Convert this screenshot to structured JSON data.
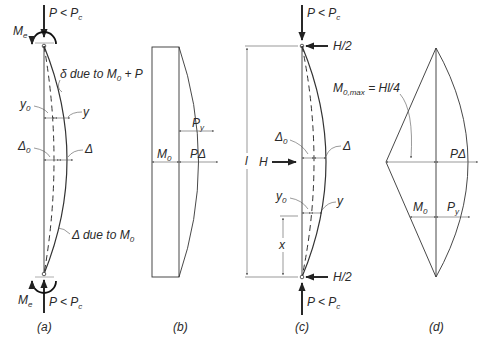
{
  "figure": {
    "panel_a": {
      "caption": "(a)",
      "top_load": "P < P",
      "top_load_sub": "c",
      "top_moment": "M",
      "top_moment_sub": "e",
      "bottom_load": "P < P",
      "bottom_load_sub": "c",
      "bottom_moment": "M",
      "bottom_moment_sub": "e",
      "delta_label_prefix": "δ due to M",
      "delta_label_sub": "0",
      "delta_label_suffix": " + P",
      "y0_label": "y",
      "y0_sub": "0",
      "y_label": "y",
      "Delta0_label": "Δ",
      "Delta0_sub": "0",
      "Delta_label": "Δ",
      "Delta_M0_prefix": "Δ due to M",
      "Delta_M0_sub": "0"
    },
    "panel_b": {
      "caption": "(b)",
      "M0_label": "M",
      "M0_sub": "0",
      "Py_label": "P",
      "Py_sub": "y",
      "PDelta_label": "PΔ"
    },
    "panel_c": {
      "caption": "(c)",
      "top_load": "P < P",
      "top_load_sub": "c",
      "bottom_load": "P < P",
      "bottom_load_sub": "c",
      "top_reaction": "H/2",
      "bottom_reaction": "H/2",
      "lateral_load": "H",
      "length_label": "l",
      "Delta0_label": "Δ",
      "Delta0_sub": "0",
      "Delta_label": "Δ",
      "y0_label": "y",
      "y0_sub": "0",
      "y_label": "y",
      "x_label": "x"
    },
    "panel_d": {
      "caption": "(d)",
      "M0max_label": "M",
      "M0max_sub": "0,max",
      "M0max_eq": " = Hl/4",
      "PDelta_label": "PΔ",
      "M0_label": "M",
      "M0_sub": "0",
      "Py_label": "P",
      "Py_sub": "y"
    }
  }
}
